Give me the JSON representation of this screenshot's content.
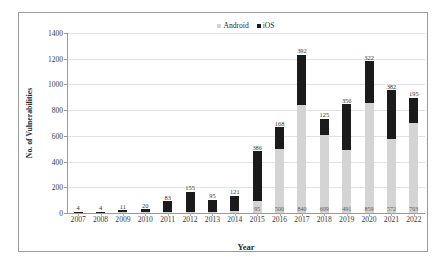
{
  "chart_data": {
    "type": "bar",
    "stacked": true,
    "title": "",
    "xlabel": "Year",
    "ylabel": "No. of Vulnerabilities",
    "ylim": [
      0,
      1400
    ],
    "yticks": [
      0,
      200,
      400,
      600,
      800,
      1000,
      1200,
      1400
    ],
    "grid": true,
    "legend_position": "top-center",
    "categories": [
      "2007",
      "2008",
      "2009",
      "2010",
      "2011",
      "2012",
      "2013",
      "2014",
      "2015",
      "2016",
      "2017",
      "2018",
      "2019",
      "2020",
      "2021",
      "2022"
    ],
    "series": [
      {
        "name": "Android",
        "color": "#d4d4d4",
        "values": [
          0,
          0,
          5,
          5,
          9,
          10,
          4,
          12,
          95,
          500,
          840,
          609,
          491,
          859,
          572,
          703
        ]
      },
      {
        "name": "iOS",
        "color": "#1b1b1b",
        "values": [
          4,
          4,
          11,
          20,
          83,
          155,
          95,
          121,
          386,
          168,
          392,
          125,
          356,
          322,
          382,
          195
        ]
      }
    ],
    "android_labels": [
      "",
      "",
      "",
      "",
      "",
      "",
      "",
      "",
      "95",
      "500",
      "840",
      "609",
      "491",
      "859",
      "572",
      "703"
    ],
    "ios_labels": [
      "4",
      "4",
      "11",
      "20",
      "83",
      "155",
      "95",
      "121",
      "386",
      "168",
      "392",
      "125",
      "356",
      "322",
      "382",
      "195"
    ]
  },
  "legend": {
    "android_label": "Android",
    "ios_label": "iOS"
  },
  "axes": {
    "y_label": "No. of Vulnerabilities",
    "x_label": "Year"
  }
}
